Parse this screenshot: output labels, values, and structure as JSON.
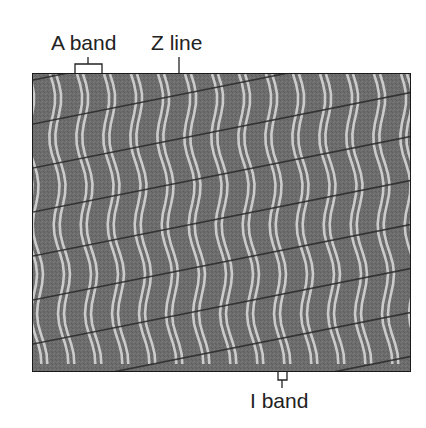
{
  "figure": {
    "type": "electron micrograph of skeletal muscle (striated)",
    "labels": {
      "a_band": "A band",
      "z_line": "Z line",
      "i_band": "I band"
    },
    "colors": {
      "background": "#ffffff",
      "micrograph_base": "#6e6e6e",
      "stripe_light": "#d8d8d8",
      "z_line_dark": "#2a2a2a",
      "frame": "#1a1a1a",
      "text": "#222222"
    }
  }
}
